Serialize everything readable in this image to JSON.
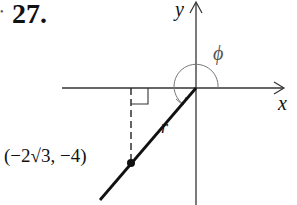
{
  "problem": {
    "number": "27.",
    "bullet": "•"
  },
  "axes": {
    "x_label": "x",
    "y_label": "y"
  },
  "angle": {
    "label": "ϕ"
  },
  "ray": {
    "label": "r"
  },
  "point": {
    "label": "(−2√3, −4)",
    "coordinates": [
      "-2√3",
      "-4"
    ]
  },
  "colors": {
    "axes": "#333333",
    "ray": "#111111",
    "angle_arc": "#777777",
    "text": "#111111"
  }
}
